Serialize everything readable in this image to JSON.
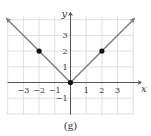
{
  "chart_data": {
    "type": "line",
    "title": "",
    "caption": "(g)",
    "xlabel": "x",
    "ylabel": "y",
    "xlim": [
      -4,
      4
    ],
    "ylim": [
      -2,
      4
    ],
    "grid": true,
    "x_ticks": [
      -3,
      -2,
      -1,
      1,
      2,
      3
    ],
    "x_tick_labels": [
      "−3",
      "−2",
      "−1",
      "1",
      "2",
      "3"
    ],
    "y_ticks": [
      -1,
      1,
      2,
      3
    ],
    "y_tick_labels": [
      "−1",
      "1",
      "2",
      "3"
    ],
    "series": [
      {
        "name": "y = |x|",
        "x": [
          -4,
          -2,
          0,
          2,
          4
        ],
        "y": [
          4,
          2,
          0,
          2,
          4
        ],
        "arrows_at_ends": true
      }
    ],
    "marked_points": [
      {
        "x": -2,
        "y": 2
      },
      {
        "x": 0,
        "y": 0
      },
      {
        "x": 2,
        "y": 2
      }
    ],
    "colors": {
      "grid": "#d8d8d8",
      "axes": "#555555",
      "curve": "#7a7a7a",
      "points": "#111111"
    }
  }
}
